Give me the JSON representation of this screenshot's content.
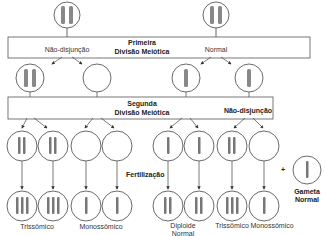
{
  "diagram": {
    "stage1_box": {
      "title_line1": "Primeira",
      "title_line2": "Divisão Meiótica",
      "left_label": "Não-disjunção",
      "right_label": "Normal"
    },
    "stage2_box": {
      "title_line1": "Segunda",
      "title_line2": "Divisão Meiótica",
      "right_label": "Não-disjunção"
    },
    "fertilization_label": "Fertilização",
    "plus_sign": "+",
    "gamete_label_line1": "Gameta",
    "gamete_label_line2": "Normal",
    "outcomes": [
      {
        "label": "Trissômico"
      },
      {
        "label": "Monossômico"
      },
      {
        "label_line1": "Diploide",
        "label_line2": "Normal"
      },
      {
        "label": "Trissômico"
      },
      {
        "label": "Monossômico"
      }
    ],
    "colors": {
      "line": "#444444",
      "chromosome": "#777777",
      "box_border": "#555555"
    }
  }
}
